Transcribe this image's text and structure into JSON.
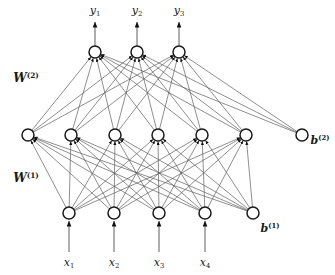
{
  "figure": {
    "type": "neural-network-diagram",
    "background_color": "#ffffff",
    "node_fill": "#ffffff",
    "node_stroke": "#1a1a1a",
    "edge_color": "#5e5e5e",
    "arrow_color": "#111111",
    "width": 335,
    "height": 275
  },
  "labels": {
    "weights": [
      {
        "name": "W2",
        "base": "W",
        "sup": "(2)",
        "x": 26,
        "y": 78
      },
      {
        "name": "W1",
        "base": "W",
        "sup": "(1)",
        "x": 26,
        "y": 178
      }
    ],
    "biases": [
      {
        "name": "b2",
        "base": "b",
        "sup": "(2)",
        "x": 320,
        "y": 140
      },
      {
        "name": "b1",
        "base": "b",
        "sup": "(1)",
        "x": 270,
        "y": 228
      }
    ],
    "outputs": [
      {
        "name": "y1",
        "base": "y",
        "sub": "1",
        "x": 95,
        "y": 11
      },
      {
        "name": "y2",
        "base": "y",
        "sub": "2",
        "x": 137,
        "y": 11
      },
      {
        "name": "y3",
        "base": "y",
        "sub": "3",
        "x": 179,
        "y": 11
      }
    ],
    "inputs": [
      {
        "name": "x1",
        "base": "x",
        "sub": "1",
        "x": 69,
        "y": 263
      },
      {
        "name": "x2",
        "base": "x",
        "sub": "2",
        "x": 114,
        "y": 263
      },
      {
        "name": "x3",
        "base": "x",
        "sub": "3",
        "x": 159,
        "y": 263
      },
      {
        "name": "x4",
        "base": "x",
        "sub": "4",
        "x": 205,
        "y": 263
      }
    ],
    "caption_partial": ""
  },
  "layers": {
    "output": {
      "label": "output-layer",
      "y": 52,
      "radius": 6,
      "nodes": [
        {
          "name": "output-node-1",
          "x": 95
        },
        {
          "name": "output-node-2",
          "x": 137
        },
        {
          "name": "output-node-3",
          "x": 179
        }
      ]
    },
    "hidden": {
      "label": "hidden-layer",
      "y": 135,
      "radius": 6,
      "nodes": [
        {
          "name": "hidden-node-1",
          "x": 28
        },
        {
          "name": "hidden-node-2",
          "x": 71
        },
        {
          "name": "hidden-node-3",
          "x": 115
        },
        {
          "name": "hidden-node-4",
          "x": 158
        },
        {
          "name": "hidden-node-5",
          "x": 202
        },
        {
          "name": "hidden-node-6",
          "x": 246
        }
      ],
      "bias": {
        "name": "bias-node-2",
        "x": 302,
        "y": 135
      }
    },
    "input": {
      "label": "input-layer",
      "y": 213,
      "radius": 6,
      "nodes": [
        {
          "name": "input-node-1",
          "x": 69
        },
        {
          "name": "input-node-2",
          "x": 114
        },
        {
          "name": "input-node-3",
          "x": 159
        },
        {
          "name": "input-node-4",
          "x": 205
        }
      ],
      "bias": {
        "name": "bias-node-1",
        "x": 253,
        "y": 213
      }
    }
  },
  "arrows": {
    "output_arrows": [
      {
        "name": "output-arrow-1",
        "x": 95,
        "y_from": 46,
        "y_to": 22
      },
      {
        "name": "output-arrow-2",
        "x": 137,
        "y_from": 46,
        "y_to": 22
      },
      {
        "name": "output-arrow-3",
        "x": 179,
        "y_from": 46,
        "y_to": 22
      }
    ],
    "input_arrows": [
      {
        "name": "input-arrow-1",
        "x": 69,
        "y_from": 252,
        "y_to": 221
      },
      {
        "name": "input-arrow-2",
        "x": 114,
        "y_from": 252,
        "y_to": 221
      },
      {
        "name": "input-arrow-3",
        "x": 159,
        "y_from": 252,
        "y_to": 221
      },
      {
        "name": "input-arrow-4",
        "x": 205,
        "y_from": 252,
        "y_to": 221
      }
    ]
  },
  "connections": {
    "input_to_hidden": "fully-connected (5 source nodes incl. bias -> 6 hidden nodes)",
    "hidden_to_output": "fully-connected (7 source nodes incl. bias -> 3 output nodes)"
  }
}
